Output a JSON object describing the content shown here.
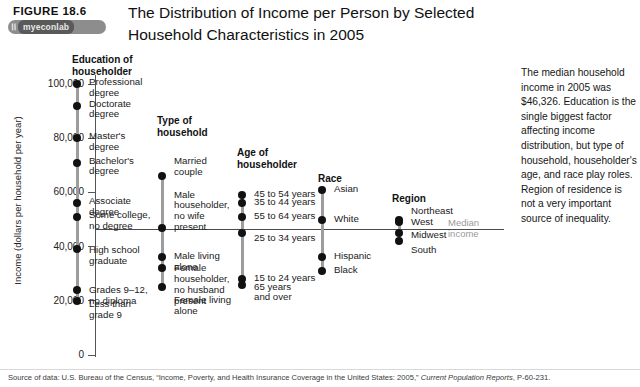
{
  "header": {
    "figure_label": "FIGURE  18.6",
    "title": "The Distribution of Income per Person by Selected Household Characteristics in 2005",
    "logo_mark": "\\\\",
    "logo_text": "myeconlab"
  },
  "sidenote": "The median household income in 2005 was $46,326. Education is the single biggest factor affecting income distribution, but type of household, householder's age, and race play roles. Region of residence is not a very important source of inequality.",
  "source": {
    "prefix": "Source of data: U.S. Bureau of the Census, “Income, Poverty, and Health Insurance Coverage in the United States: 2005,” ",
    "italic": "Current Population Reports",
    "suffix": ", P-60-231."
  },
  "median_label": "Median\nincome",
  "chart_data": {
    "type": "scatter",
    "title": "The Distribution of Income per Person by Selected Household Characteristics in 2005",
    "xlabel": "",
    "ylabel": "Income (dollars per household per year)",
    "ylim": [
      0,
      110000
    ],
    "yticks": [
      0,
      20000,
      40000,
      60000,
      80000,
      100000
    ],
    "ytick_labels": [
      "0",
      "20,000",
      "40,000",
      "60,000",
      "80,000",
      "100,000"
    ],
    "grid": false,
    "legend": "none",
    "annotations": [
      {
        "name": "median-income-line",
        "value": 46326,
        "label": "Median income"
      }
    ],
    "groups": [
      {
        "name": "Education of householder",
        "title": "Education of\nhouseholder",
        "points": [
          {
            "label": "Professional\ndegree",
            "value": 100000
          },
          {
            "label": "Doctorate\ndegree",
            "value": 92000
          },
          {
            "label": "Master's\ndegree",
            "value": 80000
          },
          {
            "label": "Bachelor's\ndegree",
            "value": 71000
          },
          {
            "label": "Associate\ndegree",
            "value": 56000
          },
          {
            "label": "Some college,\nno degree",
            "value": 51000
          },
          {
            "label": "High school\ngraduate",
            "value": 39000
          },
          {
            "label": "Grades 9–12,\nno diploma",
            "value": 24000
          },
          {
            "label": "Less than\ngrade 9",
            "value": 20000
          }
        ]
      },
      {
        "name": "Type of household",
        "title": "Type of\nhousehold",
        "points": [
          {
            "label": "Married\ncouple",
            "value": 66000
          },
          {
            "label": "Male\nhouseholder,\nno wife\npresent",
            "value": 47000
          },
          {
            "label": "Male living\nalone",
            "value": 36000
          },
          {
            "label": "Female\nhouseholder,\nno husband\npresent",
            "value": 32000
          },
          {
            "label": "Female living\nalone",
            "value": 25000
          }
        ]
      },
      {
        "name": "Age of householder",
        "title": "Age of\nhouseholder",
        "points": [
          {
            "label": "45 to 54 years",
            "value": 59000
          },
          {
            "label": "35 to 44 years",
            "value": 56000
          },
          {
            "label": "55 to 64 years",
            "value": 51000
          },
          {
            "label": "25 to 34 years",
            "value": 45000
          },
          {
            "label": "15 to 24 years",
            "value": 28000
          },
          {
            "label": "65 years\nand over",
            "value": 26000
          }
        ]
      },
      {
        "name": "Race",
        "title": "Race",
        "points": [
          {
            "label": "Asian",
            "value": 61000
          },
          {
            "label": "White",
            "value": 50000
          },
          {
            "label": "Hispanic",
            "value": 36000
          },
          {
            "label": "Black",
            "value": 31000
          }
        ]
      },
      {
        "name": "Region",
        "title": "Region",
        "points": [
          {
            "label": "Northeast",
            "value": 50000
          },
          {
            "label": "West",
            "value": 49000
          },
          {
            "label": "Midwest",
            "value": 45000
          },
          {
            "label": "South",
            "value": 42000
          }
        ]
      }
    ]
  }
}
